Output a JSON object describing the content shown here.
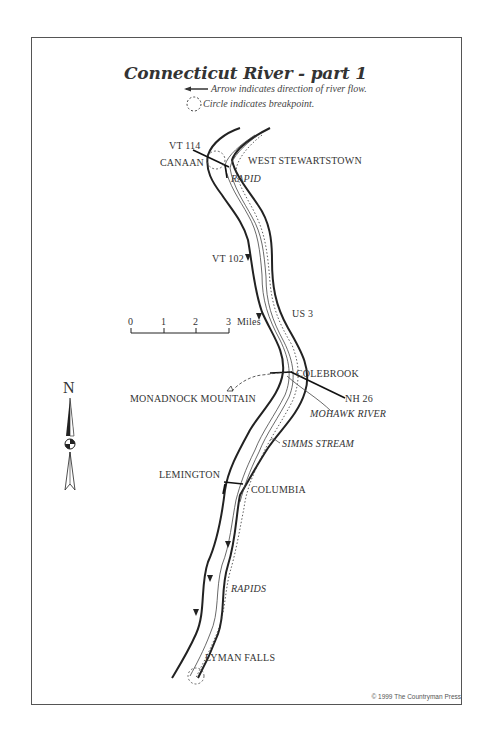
{
  "map": {
    "title": "Connecticut River - part 1",
    "legend": {
      "arrow_text": "Arrow indicates direction of river flow.",
      "circle_text": "Circle indicates breakpoint."
    },
    "scale": {
      "ticks": [
        "0",
        "1",
        "2",
        "3"
      ],
      "unit": "Miles"
    },
    "north_label": "N",
    "places": {
      "vt114": "VT 114",
      "canaan": "CANAAN",
      "west_stewartstown": "WEST STEWARTSTOWN",
      "rapid": "RAPID",
      "vt102": "VT 102",
      "us3": "US 3",
      "colebrook": "COLEBROOK",
      "monadnock": "MONADNOCK MOUNTAIN",
      "nh26": "NH 26",
      "mohawk": "MOHAWK RIVER",
      "simms": "SIMMS STREAM",
      "lemington": "LEMINGTON",
      "columbia": "COLUMBIA",
      "rapids": "RAPIDS",
      "lyman_falls": "LYMAN FALLS"
    },
    "copyright": "© 1999 The Countryman Press"
  }
}
